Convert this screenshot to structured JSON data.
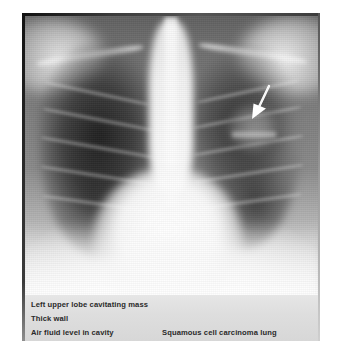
{
  "figure": {
    "modality": "chest-radiograph",
    "view": "PA chest X-ray",
    "background_color": "#ffffff",
    "plate_color": "#cfcfcf",
    "caption_band_color": "#d7d7d7",
    "caption_text_color": "#2a2a2a",
    "arrow_color": "#ffffff"
  },
  "annotations": {
    "arrow": {
      "name": "pointer-arrow",
      "points_to": "left upper lobe cavitating mass",
      "direction": "down-left"
    }
  },
  "captions": {
    "finding_mass": "Left upper lobe cavitating mass",
    "finding_wall": "Thick wall",
    "finding_air_fluid": "Air fluid level in cavity",
    "diagnosis": "Squamous cell carcinoma lung"
  }
}
